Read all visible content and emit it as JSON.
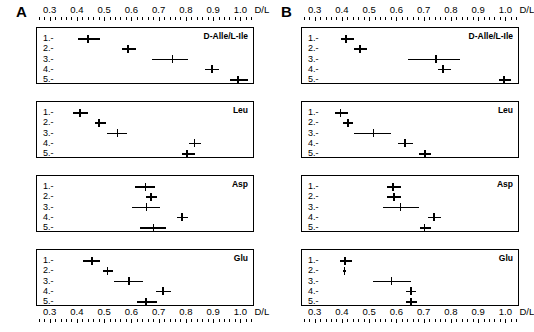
{
  "figure": {
    "axis_unit": "D/L",
    "caption": ""
  },
  "panels": [
    {
      "letter": "A",
      "subplots": [
        {
          "title": "D-Alle/L-Ile",
          "rows": [
            {
              "label": "1.-",
              "low": 0.4,
              "mean": 0.437,
              "high": 0.482
            },
            {
              "label": "2.-",
              "low": 0.563,
              "mean": 0.583,
              "high": 0.612
            },
            {
              "label": "3.-",
              "low": 0.672,
              "mean": 0.748,
              "high": 0.805
            },
            {
              "label": "4.-",
              "low": 0.868,
              "mean": 0.893,
              "high": 0.918
            },
            {
              "label": "5.-",
              "low": 0.958,
              "mean": 0.988,
              "high": 1.025
            }
          ]
        },
        {
          "title": "Leu",
          "rows": [
            {
              "label": "1.-",
              "low": 0.382,
              "mean": 0.408,
              "high": 0.437
            },
            {
              "label": "2.-",
              "low": 0.462,
              "mean": 0.477,
              "high": 0.502
            },
            {
              "label": "3.-",
              "low": 0.508,
              "mean": 0.545,
              "high": 0.58
            },
            {
              "label": "4.-",
              "low": 0.808,
              "mean": 0.828,
              "high": 0.852
            },
            {
              "label": "5.-",
              "low": 0.782,
              "mean": 0.8,
              "high": 0.828
            }
          ]
        },
        {
          "title": "Asp",
          "rows": [
            {
              "label": "1.-",
              "low": 0.608,
              "mean": 0.648,
              "high": 0.682
            },
            {
              "label": "2.-",
              "low": 0.65,
              "mean": 0.668,
              "high": 0.69
            },
            {
              "label": "3.-",
              "low": 0.598,
              "mean": 0.652,
              "high": 0.702
            },
            {
              "label": "4.-",
              "low": 0.762,
              "mean": 0.782,
              "high": 0.805
            },
            {
              "label": "5.-",
              "low": 0.628,
              "mean": 0.678,
              "high": 0.722
            }
          ]
        },
        {
          "title": "Glu",
          "rows": [
            {
              "label": "1.-",
              "low": 0.42,
              "mean": 0.452,
              "high": 0.482
            },
            {
              "label": "2.-",
              "low": 0.492,
              "mean": 0.508,
              "high": 0.528
            },
            {
              "label": "3.-",
              "low": 0.532,
              "mean": 0.588,
              "high": 0.64
            },
            {
              "label": "4.-",
              "low": 0.688,
              "mean": 0.712,
              "high": 0.742
            },
            {
              "label": "5.-",
              "low": 0.618,
              "mean": 0.65,
              "high": 0.692
            }
          ]
        }
      ]
    },
    {
      "letter": "B",
      "subplots": [
        {
          "title": "D-Alle/L-Ile",
          "rows": [
            {
              "label": "1.-",
              "low": 0.392,
              "mean": 0.412,
              "high": 0.44
            },
            {
              "label": "2.-",
              "low": 0.442,
              "mean": 0.462,
              "high": 0.488
            },
            {
              "label": "3.-",
              "low": 0.638,
              "mean": 0.742,
              "high": 0.83
            },
            {
              "label": "4.-",
              "low": 0.748,
              "mean": 0.768,
              "high": 0.798
            },
            {
              "label": "5.-",
              "low": 0.972,
              "mean": 0.992,
              "high": 1.018
            }
          ]
        },
        {
          "title": "Leu",
          "rows": [
            {
              "label": "1.-",
              "low": 0.372,
              "mean": 0.392,
              "high": 0.418
            },
            {
              "label": "2.-",
              "low": 0.4,
              "mean": 0.418,
              "high": 0.438
            },
            {
              "label": "3.-",
              "low": 0.442,
              "mean": 0.512,
              "high": 0.578
            },
            {
              "label": "4.-",
              "low": 0.602,
              "mean": 0.628,
              "high": 0.658
            },
            {
              "label": "5.-",
              "low": 0.68,
              "mean": 0.702,
              "high": 0.725
            }
          ]
        },
        {
          "title": "Asp",
          "rows": [
            {
              "label": "1.-",
              "low": 0.562,
              "mean": 0.585,
              "high": 0.612
            },
            {
              "label": "2.-",
              "low": 0.562,
              "mean": 0.588,
              "high": 0.612
            },
            {
              "label": "3.-",
              "low": 0.548,
              "mean": 0.612,
              "high": 0.678
            },
            {
              "label": "4.-",
              "low": 0.712,
              "mean": 0.735,
              "high": 0.76
            },
            {
              "label": "5.-",
              "low": 0.682,
              "mean": 0.7,
              "high": 0.725
            }
          ]
        },
        {
          "title": "Glu",
          "rows": [
            {
              "label": "1.-",
              "low": 0.388,
              "mean": 0.408,
              "high": 0.432
            },
            {
              "label": "2.-",
              "low": 0.4,
              "mean": 0.406,
              "high": 0.412
            },
            {
              "label": "3.-",
              "low": 0.51,
              "mean": 0.578,
              "high": 0.65
            },
            {
              "label": "4.-",
              "low": 0.632,
              "mean": 0.65,
              "high": 0.668
            },
            {
              "label": "5.-",
              "low": 0.63,
              "mean": 0.65,
              "high": 0.672
            }
          ]
        }
      ]
    }
  ],
  "chart_data": {
    "type": "scatter",
    "title": "",
    "xlabel": "D/L",
    "ylabel": "",
    "xlim": [
      0.25,
      1.05
    ],
    "xticks": [
      0.3,
      0.4,
      0.5,
      0.6,
      0.7,
      0.8,
      0.9,
      1.0
    ],
    "xtick_labels": [
      "0.3",
      "0.4",
      "0.5",
      "0.6",
      "0.7",
      "0.8",
      "0.9",
      "1.0"
    ],
    "minor_tick_step": 0.02,
    "grid": false,
    "legend": "none",
    "categories": [
      "1.-",
      "2.-",
      "3.-",
      "4.-",
      "5.-"
    ],
    "subplot_order": [
      "D-Alle/L-Ile",
      "Leu",
      "Asp",
      "Glu"
    ],
    "panel_order": [
      "A",
      "B"
    ],
    "marker": "mean with horizontal range bar",
    "series": [
      {
        "name": "A / D-Alle/L-Ile",
        "mean": [
          0.437,
          0.583,
          0.748,
          0.893,
          0.988
        ],
        "low": [
          0.4,
          0.563,
          0.672,
          0.868,
          0.958
        ],
        "high": [
          0.482,
          0.612,
          0.805,
          0.918,
          1.025
        ]
      },
      {
        "name": "A / Leu",
        "mean": [
          0.408,
          0.477,
          0.545,
          0.828,
          0.8
        ],
        "low": [
          0.382,
          0.462,
          0.508,
          0.808,
          0.782
        ],
        "high": [
          0.437,
          0.502,
          0.58,
          0.852,
          0.828
        ]
      },
      {
        "name": "A / Asp",
        "mean": [
          0.648,
          0.668,
          0.652,
          0.782,
          0.678
        ],
        "low": [
          0.608,
          0.65,
          0.598,
          0.762,
          0.628
        ],
        "high": [
          0.682,
          0.69,
          0.702,
          0.805,
          0.722
        ]
      },
      {
        "name": "A / Glu",
        "mean": [
          0.452,
          0.508,
          0.588,
          0.712,
          0.65
        ],
        "low": [
          0.42,
          0.492,
          0.532,
          0.688,
          0.618
        ],
        "high": [
          0.482,
          0.528,
          0.64,
          0.742,
          0.692
        ]
      },
      {
        "name": "B / D-Alle/L-Ile",
        "mean": [
          0.412,
          0.462,
          0.742,
          0.768,
          0.992
        ],
        "low": [
          0.392,
          0.442,
          0.638,
          0.748,
          0.972
        ],
        "high": [
          0.44,
          0.488,
          0.83,
          0.798,
          1.018
        ]
      },
      {
        "name": "B / Leu",
        "mean": [
          0.392,
          0.418,
          0.512,
          0.628,
          0.702
        ],
        "low": [
          0.372,
          0.4,
          0.442,
          0.602,
          0.68
        ],
        "high": [
          0.418,
          0.438,
          0.578,
          0.658,
          0.725
        ]
      },
      {
        "name": "B / Asp",
        "mean": [
          0.585,
          0.588,
          0.612,
          0.735,
          0.7
        ],
        "low": [
          0.562,
          0.562,
          0.548,
          0.712,
          0.682
        ],
        "high": [
          0.612,
          0.612,
          0.678,
          0.76,
          0.725
        ]
      },
      {
        "name": "B / Glu",
        "mean": [
          0.408,
          0.406,
          0.578,
          0.65,
          0.65
        ],
        "low": [
          0.388,
          0.4,
          0.51,
          0.632,
          0.63
        ],
        "high": [
          0.432,
          0.412,
          0.65,
          0.668,
          0.672
        ]
      }
    ]
  }
}
